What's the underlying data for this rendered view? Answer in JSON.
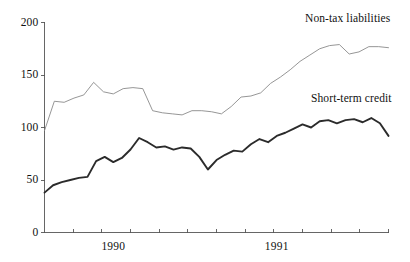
{
  "chart_data": {
    "type": "line",
    "title": "",
    "subtitle": "",
    "xlabel": "",
    "ylabel": "",
    "ylim": [
      0,
      200
    ],
    "yticks": [
      0,
      50,
      100,
      150,
      200
    ],
    "ytick_labels": [
      "0",
      "50",
      "100",
      "150",
      "200"
    ],
    "xlim": [
      0,
      24
    ],
    "xtick_positions": [
      2,
      4,
      6,
      8,
      10,
      12,
      14,
      16,
      18,
      20,
      22,
      24
    ],
    "xtick_labels": [
      "1990",
      "1991"
    ],
    "xtick_label_positions": [
      4.8,
      16.2
    ],
    "grid": false,
    "legend": "inline-annotations",
    "legend_position": "top-right and mid-right",
    "axis_color": "#555555",
    "background": "#ffffff",
    "series": [
      {
        "name": "Non-tax liabilities",
        "color": "#8a8a8a",
        "width": 0.9,
        "label_x": 305,
        "label_y": 12,
        "values": [
          97,
          125,
          124,
          128,
          131,
          143,
          134,
          132,
          137,
          138,
          137,
          116,
          114,
          113,
          112,
          116,
          116,
          115,
          113,
          120,
          129,
          130,
          133,
          142,
          148,
          155,
          163,
          169,
          175,
          178,
          179,
          170,
          172,
          177,
          177,
          176
        ]
      },
      {
        "name": "Short-term credit",
        "color": "#2b2b2b",
        "width": 1.9,
        "label_x": 311,
        "label_y": 92,
        "values": [
          38,
          45,
          48,
          50,
          52,
          53,
          68,
          72,
          67,
          71,
          79,
          90,
          86,
          81,
          82,
          79,
          81,
          80,
          72,
          60,
          69,
          74,
          78,
          77,
          84,
          89,
          86,
          92,
          95,
          99,
          103,
          100,
          106,
          107,
          104,
          107,
          108,
          105,
          109,
          104,
          92
        ]
      }
    ]
  },
  "axes": {
    "y_axis_name": "value-axis",
    "x_axis_name": "time-axis"
  }
}
